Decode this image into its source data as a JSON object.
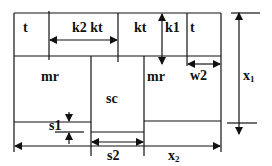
{
  "diagram": {
    "labels": {
      "t_left": "t",
      "k2kt": "k2  kt",
      "kt": "kt",
      "k1": "k1",
      "t_right": "t",
      "mr_left": "mr",
      "sc": "sc",
      "mr_right": "mr",
      "w2": "w2",
      "x1": "x",
      "x1_sub": "1",
      "s1": "s1",
      "s2": "s2",
      "x2": "x",
      "x2_sub": "2"
    },
    "colors": {
      "stroke": "#111111",
      "background": "#ffffff"
    }
  }
}
